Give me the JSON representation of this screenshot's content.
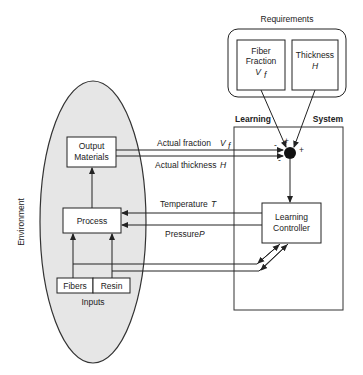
{
  "requirements": {
    "title": "Requirements",
    "fiber_fraction": {
      "line1": "Fiber",
      "line2": "Fraction",
      "symbol": "V",
      "subscript": "f"
    },
    "thickness": {
      "line1": "Thickness",
      "symbol": "H"
    }
  },
  "learning_system": {
    "label_left": "Learning",
    "label_right": "System",
    "controller": {
      "line1": "Learning",
      "line2": "Controller"
    }
  },
  "environment": {
    "label": "Environment",
    "output_materials": {
      "line1": "Output",
      "line2": "Materials"
    },
    "process": "Process",
    "inputs": {
      "label": "Inputs",
      "fibers": "Fibers",
      "resin": "Resin"
    }
  },
  "signals": {
    "actual_fraction": "Actual fraction",
    "actual_fraction_symbol": "V",
    "actual_fraction_sub": "f",
    "actual_thickness": "Actual thickness",
    "actual_thickness_symbol": "H",
    "temperature": "Temperature",
    "temperature_symbol": "T",
    "pressure": "Pressure",
    "pressure_symbol": "P"
  },
  "junction_signs": {
    "top_left": "+",
    "top_right": "+",
    "left": "-",
    "bottom_left": "-"
  },
  "colors": {
    "environment_fill": "#e6e6e6",
    "line": "#222222"
  }
}
